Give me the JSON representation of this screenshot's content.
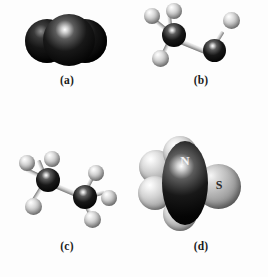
{
  "figure": {
    "background_color": "#fdfdfd",
    "panel_count": 4
  },
  "panels": [
    {
      "id": "a",
      "caption": "(a)",
      "model_type": "space-filling",
      "description": "Linear triatomic molecule of three overlapping dark spheres",
      "atoms": [
        {
          "element_color": "dark",
          "label": "",
          "position": "left"
        },
        {
          "element_color": "dark",
          "label": "",
          "position": "center"
        },
        {
          "element_color": "dark",
          "label": "",
          "position": "right"
        }
      ]
    },
    {
      "id": "b",
      "caption": "(b)",
      "model_type": "ball-and-stick",
      "description": "Dark central atom with three light atoms, bonded to a second dark atom bearing one light atom",
      "atoms": [
        {
          "element_color": "dark",
          "label": "",
          "position": "center-left"
        },
        {
          "element_color": "light",
          "label": "",
          "position": "upper-left"
        },
        {
          "element_color": "light",
          "label": "",
          "position": "top"
        },
        {
          "element_color": "light",
          "label": "",
          "position": "lower-left"
        },
        {
          "element_color": "dark",
          "label": "",
          "position": "right"
        },
        {
          "element_color": "light",
          "label": "",
          "position": "upper-right"
        }
      ]
    },
    {
      "id": "c",
      "caption": "(c)",
      "model_type": "ball-and-stick",
      "description": "Two dark atoms joined by a bond, each carrying three light atoms",
      "atoms": [
        {
          "element_color": "dark",
          "label": "",
          "position": "left-center"
        },
        {
          "element_color": "light",
          "label": "",
          "position": "left-top"
        },
        {
          "element_color": "light",
          "label": "",
          "position": "left-upper"
        },
        {
          "element_color": "light",
          "label": "",
          "position": "left-lower"
        },
        {
          "element_color": "dark",
          "label": "",
          "position": "right-center"
        },
        {
          "element_color": "light",
          "label": "",
          "position": "right-top"
        },
        {
          "element_color": "light",
          "label": "",
          "position": "right-lower"
        },
        {
          "element_color": "light",
          "label": "",
          "position": "right-bottom"
        }
      ]
    },
    {
      "id": "d",
      "caption": "(d)",
      "model_type": "space-filling",
      "description": "Large space-filling model with a labeled dark atom and a labeled gray atom",
      "atoms": [
        {
          "element_color": "light",
          "label": "",
          "position": "upper-left"
        },
        {
          "element_color": "light",
          "label": "",
          "position": "top"
        },
        {
          "element_color": "light",
          "label": "",
          "position": "lower-left"
        },
        {
          "element_color": "light",
          "label": "",
          "position": "bottom"
        },
        {
          "element_color": "dark",
          "label": "N",
          "position": "center"
        },
        {
          "element_color": "gray",
          "label": "S",
          "position": "right"
        }
      ],
      "labels": [
        {
          "text": "N",
          "on_color": "dark"
        },
        {
          "text": "S",
          "on_color": "gray"
        }
      ]
    }
  ],
  "colors": {
    "dark_atom": "#0a0a0a",
    "light_atom": "#d2d2d2",
    "gray_atom": "#9a9a9a",
    "bond": "#c8c8c8",
    "background": "#fdfdfd",
    "caption_text": "#1b1b1b",
    "label_light": "#f4f4f4",
    "label_dark": "#2a2a2a"
  }
}
